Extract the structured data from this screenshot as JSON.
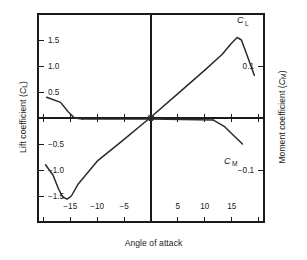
{
  "chart_data": {
    "type": "line",
    "title": "",
    "xlabel": "Angle of attack",
    "ylabel_left": "Lift coefficient (CL)",
    "ylabel_right": "Moment coefficient (CM)",
    "grid": false,
    "legend": "inline-annotations",
    "xlim": [
      -21,
      21
    ],
    "xticks": [
      -20,
      -15,
      -10,
      -5,
      0,
      5,
      10,
      15,
      20
    ],
    "xtick_labels": [
      "",
      "−15",
      "−10",
      "−5",
      "",
      "5",
      "10",
      "15",
      ""
    ],
    "ylim_left": [
      -2.0,
      2.0
    ],
    "yticks_left": [
      -2.0,
      -1.5,
      -1.0,
      -0.5,
      0,
      0.5,
      1.0,
      1.5,
      2.0
    ],
    "ytick_labels_left": [
      "",
      "−1.5",
      "−1.0",
      "−0.5",
      "",
      "0.5",
      "1.0",
      "1.5",
      ""
    ],
    "ylim_right": [
      -0.2,
      0.2
    ],
    "yticks_right": [
      -0.2,
      -0.1,
      0,
      0.1,
      0.2
    ],
    "ytick_labels_right": [
      "",
      "−0.1",
      "",
      "0.1",
      ""
    ],
    "series": [
      {
        "name": "CL",
        "label": "CL",
        "axis": "left",
        "points": [
          [
            -19.6,
            -0.9
          ],
          [
            -18.2,
            -1.1
          ],
          [
            -17.2,
            -1.36
          ],
          [
            -16.4,
            -1.52
          ],
          [
            -15.6,
            -1.56
          ],
          [
            -14.8,
            -1.5
          ],
          [
            -13.6,
            -1.28
          ],
          [
            -10.0,
            -0.83
          ],
          [
            -5.0,
            -0.41
          ],
          [
            0.0,
            0.02
          ],
          [
            5.0,
            0.47
          ],
          [
            10.0,
            0.92
          ],
          [
            13.2,
            1.22
          ],
          [
            14.8,
            1.42
          ],
          [
            16.0,
            1.55
          ],
          [
            16.8,
            1.5
          ],
          [
            17.8,
            1.22
          ],
          [
            19.2,
            0.82
          ]
        ]
      },
      {
        "name": "CM-left",
        "label": "CM",
        "axis": "right",
        "points": [
          [
            -19.4,
            0.04
          ],
          [
            -16.8,
            0.03
          ],
          [
            -15.4,
            0.012
          ],
          [
            -14.2,
            0.0
          ],
          [
            -12.8,
            -0.002
          ]
        ]
      },
      {
        "name": "CM-zero",
        "label": "",
        "axis": "right",
        "points": [
          [
            -12.8,
            -0.002
          ],
          [
            0.0,
            -0.002
          ],
          [
            11.6,
            -0.004
          ]
        ]
      },
      {
        "name": "CM-right",
        "label": "CM",
        "axis": "right",
        "points": [
          [
            11.6,
            -0.004
          ],
          [
            13.6,
            -0.016
          ],
          [
            15.4,
            -0.034
          ],
          [
            17.0,
            -0.05
          ]
        ]
      }
    ],
    "annotations": [
      {
        "name": "cl-label",
        "text": "CL",
        "x": 16.6,
        "y": 1.82,
        "axis": "left"
      },
      {
        "name": "cm-label",
        "text": "CM",
        "x": 14.2,
        "y": -0.088,
        "axis": "right"
      }
    ],
    "origin_marker": {
      "x": 0,
      "y": 0,
      "shape": "circle"
    }
  },
  "labels": {
    "x_axis_title": "Angle of attack",
    "y_axis_left_main": "Lift coefficient (",
    "y_axis_left_sym": "C",
    "y_axis_left_sub": "L",
    "y_axis_right_main": "Moment coefficient (",
    "y_axis_right_sym": "C",
    "y_axis_right_sub": "M",
    "paren_close": ")"
  },
  "style": {
    "line_color": "#2b2b2b",
    "axis_color": "#1b1b1b",
    "text_color": "#1b1b1b",
    "background": "#ffffff"
  }
}
